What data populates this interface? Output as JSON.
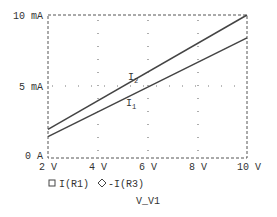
{
  "chart_data": {
    "type": "line",
    "title": "",
    "xlabel": "V_V1",
    "ylabel": "",
    "xlim": [
      2,
      10
    ],
    "ylim": [
      0,
      10
    ],
    "x_ticks": [
      "2 V",
      "4 V",
      "6 V",
      "8 V",
      "10 V"
    ],
    "y_ticks": [
      "0 A",
      "5 mA",
      "10 mA"
    ],
    "grid": "dotted",
    "x": [
      2,
      10
    ],
    "series": [
      {
        "name": "I(R1)",
        "marker": "square",
        "annotation": "I1",
        "values": [
          1.5,
          8.4
        ]
      },
      {
        "name": "-I(R3)",
        "marker": "diamond",
        "annotation": "I2",
        "values": [
          2.0,
          10.0
        ]
      }
    ],
    "legend": [
      "I(R1)",
      "-I(R3)"
    ],
    "legend_position": "bottom"
  },
  "labels": {
    "y_top": "10 mA",
    "y_mid": "5 mA",
    "y_bottom": "0 A",
    "x0": "2 V",
    "x1": "4 V",
    "x2": "6 V",
    "x3": "8 V",
    "x4": "10 V",
    "legend1": "I(R1)",
    "legend2": "-I(R3)",
    "xlabel": "V_V1",
    "ann_i2": "I",
    "ann_i2_sub": "2",
    "ann_i1": "I",
    "ann_i1_sub": "1"
  }
}
